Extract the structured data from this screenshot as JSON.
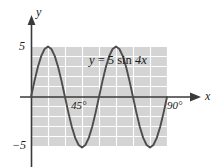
{
  "figure": {
    "name": "sine-curve-graph",
    "background_color": "#ffffff",
    "plot_fill_color": "#d4d4d4",
    "grid_color": "#ffffff",
    "curve_color": "#4d4d4d",
    "axis_color": "#3a3a3a",
    "text_color": "#1a1a1a"
  },
  "labels": {
    "y_axis": "y",
    "x_axis": "x",
    "equation_lhs": "y",
    "equation_eq": " = 5 ",
    "equation_fn": "sin",
    "equation_arg": " 4x",
    "equation_full": "y = 5 sin 4x"
  },
  "ticks": {
    "y_positive": "5",
    "y_negative": "−5",
    "x_mid": "45°",
    "x_end": "90°"
  },
  "chart_data": {
    "type": "line",
    "title": "",
    "subtitle": "",
    "xlabel": "x",
    "ylabel": "y",
    "equation": "y = 5 sin 4x",
    "amplitude": 5,
    "frequency_multiplier": 4,
    "period_degrees": 90,
    "xlim": [
      0,
      90
    ],
    "ylim": [
      -5,
      5
    ],
    "xunits": "degrees",
    "grid": true,
    "grid_style": "white lines on gray panel",
    "legend": "none",
    "x_tick_labels": [
      "45°",
      "90°"
    ],
    "x_tick_values": [
      45,
      90
    ],
    "y_tick_labels": [
      "5",
      "−5"
    ],
    "y_tick_values": [
      5,
      -5
    ],
    "annotations": [
      {
        "text": "y = 5 sin 4x",
        "x": 38,
        "y": 3.2
      }
    ],
    "key_points": [
      {
        "x": 0,
        "y": 0,
        "kind": "zero-crossing"
      },
      {
        "x": 22.5,
        "y": 5,
        "kind": "maximum"
      },
      {
        "x": 45,
        "y": 0,
        "kind": "zero-crossing"
      },
      {
        "x": 67.5,
        "y": -5,
        "kind": "minimum"
      },
      {
        "x": 90,
        "y": 0,
        "kind": "zero-crossing"
      }
    ],
    "x": [
      0,
      2.25,
      4.5,
      6.75,
      9,
      11.25,
      13.5,
      15.75,
      18,
      20.25,
      22.5,
      24.75,
      27,
      29.25,
      31.5,
      33.75,
      36,
      38.25,
      40.5,
      42.75,
      45,
      47.25,
      49.5,
      51.75,
      54,
      56.25,
      58.5,
      60.75,
      63,
      65.25,
      67.5,
      69.75,
      72,
      74.25,
      76.5,
      78.75,
      81,
      83.25,
      85.5,
      87.75,
      90
    ],
    "y": [
      0,
      1.545,
      2.939,
      4.045,
      4.755,
      5,
      4.755,
      4.045,
      2.939,
      1.545,
      0,
      -1.545,
      -2.939,
      -4.045,
      -4.755,
      -5,
      -4.755,
      -4.045,
      -2.939,
      -1.545,
      0,
      1.545,
      2.939,
      4.045,
      4.755,
      5,
      4.755,
      4.045,
      2.939,
      1.545,
      0,
      -1.545,
      -2.939,
      -4.045,
      -4.755,
      -5,
      -4.755,
      -4.045,
      -2.939,
      -1.545,
      0
    ]
  }
}
